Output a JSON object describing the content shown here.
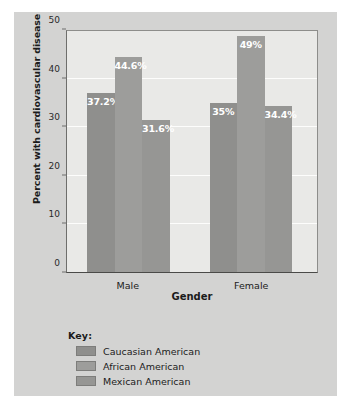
{
  "chart_data": {
    "type": "bar",
    "title": "",
    "xlabel": "Gender",
    "ylabel": "Percent with cardiovascular disease",
    "categories": [
      "Male",
      "Female"
    ],
    "series": [
      {
        "name": "Caucasian American",
        "color": "#8f8f8d",
        "values": [
          37.2,
          35
        ],
        "labels": [
          "37.2%",
          "35%"
        ]
      },
      {
        "name": "African American",
        "color": "#9d9d9b",
        "values": [
          44.6,
          49
        ],
        "labels": [
          "44.6%",
          "49%"
        ]
      },
      {
        "name": "Mexican American",
        "color": "#969694",
        "values": [
          31.6,
          34.4
        ],
        "labels": [
          "31.6%",
          "34.4%"
        ]
      }
    ],
    "ylim": [
      0,
      50
    ],
    "yticks": [
      0,
      10,
      20,
      30,
      40,
      50
    ],
    "ytick_labels": [
      "0",
      "10",
      "20",
      "30",
      "40",
      "50"
    ],
    "grid": true,
    "legend_position": "below-plot"
  },
  "legend": {
    "title": "Key:",
    "entries": [
      {
        "label": "Caucasian American",
        "color": "#8f8f8d"
      },
      {
        "label": "African American",
        "color": "#9d9d9b"
      },
      {
        "label": "Mexican American",
        "color": "#969694"
      }
    ]
  },
  "colors": {
    "figure_background": "#d3d3d2",
    "plot_background": "#e9e9e7",
    "gridline": "#fdfdfc",
    "axis": "#4a4a48",
    "text": "#1b1b1b",
    "bar_label_text": "#ffffff"
  }
}
